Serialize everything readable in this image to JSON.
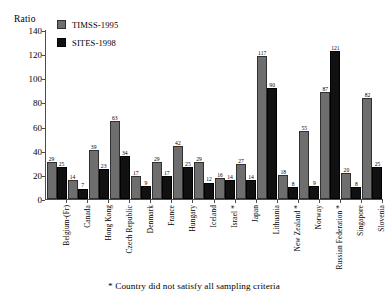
{
  "chart_data": {
    "type": "bar",
    "title": "",
    "ylabel": "Ratio",
    "xlabel": "",
    "ylim": [
      0,
      140
    ],
    "yticks": [
      0,
      20,
      40,
      60,
      80,
      100,
      120,
      140
    ],
    "grid": false,
    "legend_position": "top-left",
    "categories": [
      "Belgium-(Fr)",
      "Canada",
      "Hong Kong",
      "Czech Republic",
      "Denmark",
      "France",
      "Hungary",
      "Iceland",
      "Israel *",
      "Japan",
      "Lithuania",
      "New Zealand *",
      "Norway",
      "Russian Federation *",
      "Singapore",
      "Slovenia"
    ],
    "series": [
      {
        "name": "TIMSS-1995",
        "color": "#6e6e6e",
        "values": [
          29,
          14,
          39,
          63,
          17,
          29,
          42,
          29,
          16,
          27,
          117,
          18,
          55,
          87,
          20,
          82
        ]
      },
      {
        "name": "SITES-1998",
        "color": "#111111",
        "values": [
          25,
          7,
          23,
          34,
          9,
          17,
          25,
          12,
          14,
          14,
          90,
          8,
          9,
          121,
          8,
          25
        ]
      }
    ],
    "annotations": [
      "* Country did not satisfy all sampling criteria"
    ]
  },
  "footnote": {
    "text": "* Country did not satisfy all sampling criteria"
  }
}
